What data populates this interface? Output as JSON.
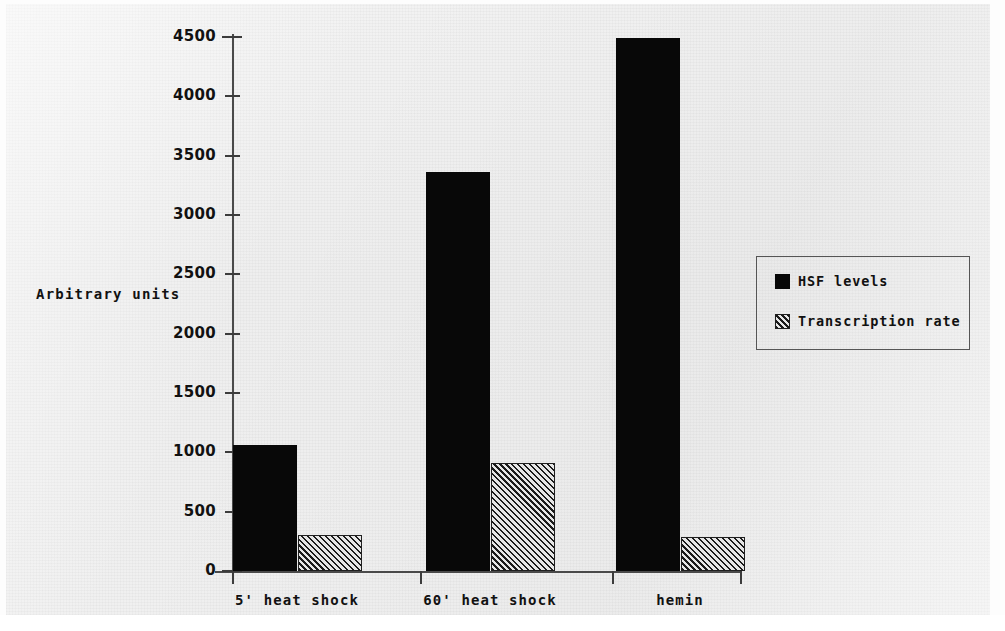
{
  "chart_data": {
    "type": "bar",
    "title": "",
    "xlabel": "",
    "ylabel": "Arbitrary units",
    "ylim": [
      0,
      4500
    ],
    "grid": false,
    "legend_position": "right",
    "y_ticks": [
      0,
      500,
      1000,
      1500,
      2000,
      2500,
      3000,
      3500,
      4000,
      4500
    ],
    "y_tick_labels": [
      "0",
      "500",
      "1000",
      "1500",
      "2000",
      "2500",
      "3000",
      "3500",
      "4000",
      "4500"
    ],
    "categories": [
      "5' heat shock",
      "60' heat shock",
      "hemin"
    ],
    "series": [
      {
        "name": "HSF levels",
        "fill": "solid",
        "color": "#080808",
        "values": [
          1060,
          3360,
          4490
        ]
      },
      {
        "name": "Transcription rate",
        "fill": "diagonal-hatch",
        "color": "#1b1b1b",
        "values": [
          300,
          910,
          285
        ]
      }
    ]
  },
  "axis": {
    "y_label": "Arbitrary units"
  },
  "legend": {
    "entries": [
      {
        "label": "HSF levels",
        "swatch": "solid-black-square"
      },
      {
        "label": "Transcription rate",
        "swatch": "hatched-square"
      }
    ]
  }
}
